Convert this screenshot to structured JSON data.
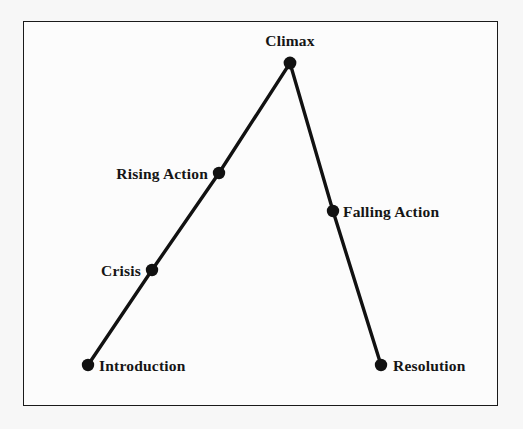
{
  "figure": {
    "name": "freytag-pyramid",
    "title": "",
    "frame": {
      "x": 23,
      "y": 21,
      "width": 475,
      "height": 385,
      "border_color": "#1a1a1a",
      "fill_color": "#fcfcfc"
    },
    "page_background": "#f7f7f7"
  },
  "style": {
    "line_color": "#111111",
    "line_width": 3.4,
    "marker_color": "#111111",
    "marker_radius": 6.2,
    "label_color": "#151515"
  },
  "chart_data": {
    "type": "line",
    "xlabel": "",
    "ylabel": "",
    "grid": false,
    "legend": "none",
    "xlim": [
      23,
      498
    ],
    "ylim": [
      406,
      21
    ],
    "categories": [
      "Introduction",
      "Crisis",
      "Rising Action",
      "Climax",
      "Falling Action",
      "Resolution"
    ],
    "x": [
      88,
      152,
      219,
      290,
      333,
      381
    ],
    "y": [
      365,
      270,
      173,
      63,
      211,
      365
    ],
    "values": [
      365,
      270,
      173,
      63,
      211,
      365
    ],
    "annotations": [
      {
        "text": "Introduction",
        "x": 88,
        "y": 365,
        "placement": "right"
      },
      {
        "text": "Crisis",
        "x": 152,
        "y": 270,
        "placement": "left"
      },
      {
        "text": "Rising Action",
        "x": 219,
        "y": 173,
        "placement": "left"
      },
      {
        "text": "Climax",
        "x": 290,
        "y": 63,
        "placement": "above"
      },
      {
        "text": "Falling Action",
        "x": 333,
        "y": 211,
        "placement": "right"
      },
      {
        "text": "Resolution",
        "x": 381,
        "y": 365,
        "placement": "right"
      }
    ]
  },
  "labels": {
    "introduction": "Introduction",
    "crisis": "Crisis",
    "rising_action": "Rising Action",
    "climax": "Climax",
    "falling_action": "Falling Action",
    "resolution": "Resolution"
  }
}
